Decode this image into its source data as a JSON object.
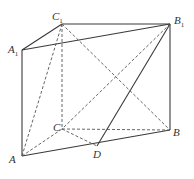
{
  "diagram": {
    "type": "triangular-prism",
    "labels": {
      "A1": "A",
      "A1_sub": "1",
      "B1": "B",
      "B1_sub": "1",
      "C1": "C",
      "C1_sub": "1",
      "A": "A",
      "B": "B",
      "C": "C",
      "D": "D"
    },
    "points": {
      "A1": [
        22,
        50
      ],
      "C1": [
        62,
        24
      ],
      "B1": [
        170,
        24
      ],
      "A": [
        22,
        156
      ],
      "C": [
        62,
        129
      ],
      "B": [
        170,
        130
      ],
      "D": [
        97,
        146
      ]
    },
    "solid_edges": [
      [
        "A1",
        "C1"
      ],
      [
        "C1",
        "B1"
      ],
      [
        "A1",
        "B1"
      ],
      [
        "A1",
        "A"
      ],
      [
        "B1",
        "B"
      ],
      [
        "A",
        "B"
      ],
      [
        "B1",
        "D"
      ]
    ],
    "dashed_edges": [
      [
        "C1",
        "C"
      ],
      [
        "A",
        "C1"
      ],
      [
        "A",
        "C"
      ],
      [
        "C",
        "B"
      ],
      [
        "C",
        "D"
      ],
      [
        "C1",
        "B"
      ],
      [
        "B1",
        "C"
      ]
    ],
    "stroke_color": "#3a3a3a"
  }
}
